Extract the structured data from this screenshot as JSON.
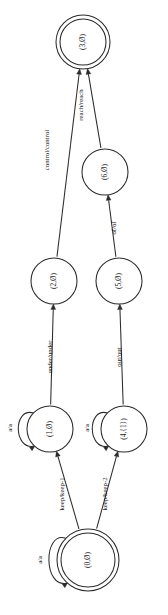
{
  "diagram": {
    "type": "finite-state-transducer",
    "orientation": "rotated-90-ccw",
    "canvas": {
      "width": 168,
      "height": 615
    },
    "background_color": "#ffffff",
    "stroke_color": "#2b2b2b",
    "text_color": "#1a1a1a"
  },
  "nodes": [
    {
      "id": "n3",
      "label": "(3,Ø)",
      "shape": "doublecircle",
      "accepting": true,
      "initial": false,
      "cx": 83,
      "cy": 42,
      "r": 27,
      "r_inner": 23
    },
    {
      "id": "n6",
      "label": "(6,Ø)",
      "shape": "circle",
      "accepting": false,
      "initial": false,
      "cx": 105,
      "cy": 172,
      "r": 23,
      "r_inner": 0
    },
    {
      "id": "n2",
      "label": "(2,Ø)",
      "shape": "circle",
      "accepting": false,
      "initial": false,
      "cx": 54,
      "cy": 281,
      "r": 23,
      "r_inner": 0
    },
    {
      "id": "n5",
      "label": "(5,Ø)",
      "shape": "circle",
      "accepting": false,
      "initial": false,
      "cx": 119,
      "cy": 281,
      "r": 23,
      "r_inner": 0
    },
    {
      "id": "n1",
      "label": "(1,Ø)",
      "shape": "circle",
      "accepting": false,
      "initial": false,
      "cx": 50,
      "cy": 429,
      "r": 23,
      "r_inner": 0
    },
    {
      "id": "n4",
      "label": "(4,{1})",
      "shape": "circle",
      "accepting": false,
      "initial": false,
      "cx": 124,
      "cy": 429,
      "r": 23,
      "r_inner": 0
    },
    {
      "id": "n0",
      "label": "(0,Ø)",
      "shape": "doublecircle",
      "accepting": true,
      "initial": true,
      "cx": 88,
      "cy": 560,
      "r": 31,
      "r_inner": 27
    }
  ],
  "edges": [
    {
      "id": "e1",
      "from": "n2",
      "to": "n3",
      "label": "control/control",
      "label_x": 47,
      "label_y": 150
    },
    {
      "id": "e2",
      "from": "n6",
      "to": "n3",
      "label": "reach/reach",
      "label_x": 81,
      "label_y": 105
    },
    {
      "id": "e3",
      "from": "n5",
      "to": "n6",
      "label": "of/of",
      "label_x": 114,
      "label_y": 228
    },
    {
      "id": "e4",
      "from": "n1",
      "to": "n2",
      "label": "under/under",
      "label_x": 50,
      "label_y": 357
    },
    {
      "id": "e5",
      "from": "n4",
      "to": "n5",
      "label": "out/out",
      "label_x": 119,
      "label_y": 357
    },
    {
      "id": "e6",
      "from": "n0",
      "to": "n1",
      "label": "keep/keep-1",
      "label_x": 62,
      "label_y": 494
    },
    {
      "id": "e7",
      "from": "n0",
      "to": "n4",
      "label": "keep/keep-2",
      "label_x": 105,
      "label_y": 494
    }
  ],
  "self_loops": [
    {
      "id": "l1",
      "node": "n1",
      "label": "a/a",
      "label_x": 11,
      "label_y": 428
    },
    {
      "id": "l2",
      "node": "n4",
      "label": "a/a",
      "label_x": 88,
      "label_y": 428
    },
    {
      "id": "l3",
      "node": "n0",
      "label": "a/a",
      "label_x": 41,
      "label_y": 560
    }
  ]
}
